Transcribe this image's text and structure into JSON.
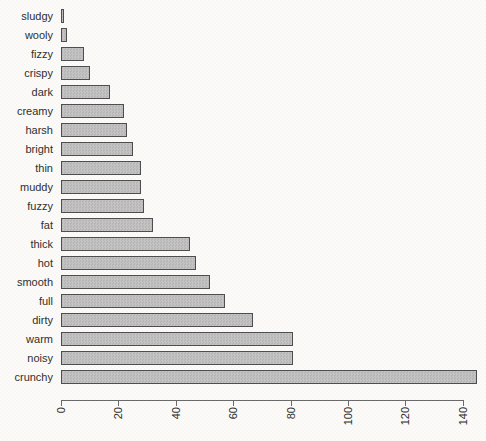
{
  "chart_data": {
    "type": "bar",
    "orientation": "horizontal",
    "title": "",
    "xlabel": "",
    "ylabel": "",
    "grid": false,
    "legend": null,
    "categories": [
      "sludgy",
      "wooly",
      "fizzy",
      "crispy",
      "dark",
      "creamy",
      "harsh",
      "bright",
      "thin",
      "muddy",
      "fuzzy",
      "fat",
      "thick",
      "hot",
      "smooth",
      "full",
      "dirty",
      "warm",
      "noisy",
      "crunchy"
    ],
    "values": [
      1,
      2,
      8,
      10,
      17,
      22,
      23,
      25,
      28,
      28,
      29,
      32,
      45,
      47,
      52,
      57,
      67,
      81,
      81,
      145
    ],
    "x_ticks": [
      0,
      20,
      40,
      60,
      80,
      100,
      120,
      140
    ],
    "x_tick_labels": [
      "0",
      "20",
      "40",
      "60",
      "80",
      "100",
      "120",
      "140"
    ],
    "xlim": [
      0,
      147
    ],
    "x_tick_label_rotation_deg": 90,
    "bar_fill_color": "#bdbdbd",
    "bar_border_color": "#4e4e4e",
    "axis_color": "#6a6a6a",
    "text_color": "#2f2f2f",
    "background_color": "#fbfaf8"
  }
}
